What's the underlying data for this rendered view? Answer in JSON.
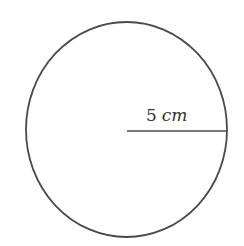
{
  "diagram": {
    "shape": "circle",
    "radius_label": {
      "value": "5",
      "unit": "cm"
    },
    "stroke_color": "#4a4a4a",
    "background": "#ffffff"
  }
}
